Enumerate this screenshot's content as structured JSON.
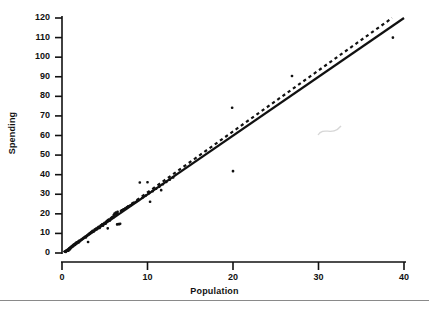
{
  "figure": {
    "background_color": "#ffffff",
    "ink_color": "#111111",
    "artifact_color": "#c8c8c8"
  },
  "chart_data": {
    "type": "scatter",
    "title": "",
    "subtitle": "",
    "xlabel": "Population",
    "ylabel": "Spending",
    "xlim": [
      0,
      40
    ],
    "ylim": [
      0,
      120
    ],
    "xticks": [
      0,
      10,
      20,
      30,
      40
    ],
    "yticks": [
      0,
      10,
      20,
      30,
      40,
      50,
      60,
      70,
      80,
      90,
      100,
      110,
      120
    ],
    "xtick_labels": [
      "0",
      "10",
      "20",
      "30",
      "40"
    ],
    "ytick_labels": [
      "0",
      "10",
      "20",
      "30",
      "40",
      "50",
      "60",
      "70",
      "80",
      "90",
      "100",
      "110",
      "120"
    ],
    "grid": false,
    "legend": null,
    "legend_position": "none",
    "marker": "filled-square-dot",
    "marker_size": 2.6,
    "points": [
      [
        0.45,
        0.6
      ],
      [
        0.55,
        1.0
      ],
      [
        0.6,
        1.3
      ],
      [
        0.7,
        1.5
      ],
      [
        0.75,
        1.2
      ],
      [
        0.8,
        2.0
      ],
      [
        0.85,
        1.8
      ],
      [
        0.9,
        2.4
      ],
      [
        0.95,
        2.0
      ],
      [
        1.0,
        2.6
      ],
      [
        1.05,
        3.0
      ],
      [
        1.1,
        2.8
      ],
      [
        1.15,
        3.4
      ],
      [
        1.2,
        3.2
      ],
      [
        1.25,
        3.8
      ],
      [
        1.3,
        3.5
      ],
      [
        1.35,
        4.2
      ],
      [
        1.4,
        4.0
      ],
      [
        1.45,
        4.4
      ],
      [
        1.5,
        4.1
      ],
      [
        1.55,
        4.8
      ],
      [
        1.6,
        4.5
      ],
      [
        1.65,
        5.2
      ],
      [
        1.7,
        4.9
      ],
      [
        1.75,
        5.5
      ],
      [
        1.8,
        5.1
      ],
      [
        1.9,
        5.8
      ],
      [
        1.95,
        5.4
      ],
      [
        2.0,
        6.2
      ],
      [
        2.1,
        6.0
      ],
      [
        2.2,
        6.6
      ],
      [
        2.3,
        6.9
      ],
      [
        2.4,
        7.2
      ],
      [
        2.5,
        7.6
      ],
      [
        2.6,
        7.9
      ],
      [
        2.7,
        8.3
      ],
      [
        2.8,
        8.0
      ],
      [
        2.9,
        8.8
      ],
      [
        3.0,
        9.2
      ],
      [
        3.05,
        5.6
      ],
      [
        3.1,
        9.5
      ],
      [
        3.2,
        9.9
      ],
      [
        3.3,
        10.2
      ],
      [
        3.4,
        10.6
      ],
      [
        3.5,
        10.9
      ],
      [
        3.6,
        11.3
      ],
      [
        3.7,
        11.0
      ],
      [
        3.8,
        11.8
      ],
      [
        3.9,
        12.1
      ],
      [
        4.0,
        12.5
      ],
      [
        4.1,
        12.2
      ],
      [
        4.2,
        13.0
      ],
      [
        4.3,
        13.4
      ],
      [
        4.4,
        12.8
      ],
      [
        4.5,
        13.9
      ],
      [
        4.6,
        14.2
      ],
      [
        4.7,
        14.6
      ],
      [
        4.8,
        14.0
      ],
      [
        4.9,
        15.1
      ],
      [
        5.0,
        15.4
      ],
      [
        5.1,
        15.0
      ],
      [
        5.2,
        16.0
      ],
      [
        5.3,
        16.4
      ],
      [
        5.35,
        12.6
      ],
      [
        5.4,
        16.8
      ],
      [
        5.5,
        17.1
      ],
      [
        5.6,
        16.6
      ],
      [
        5.7,
        17.6
      ],
      [
        5.8,
        18.0
      ],
      [
        5.9,
        18.4
      ],
      [
        6.0,
        18.1
      ],
      [
        6.05,
        19.4
      ],
      [
        6.1,
        19.0
      ],
      [
        6.15,
        20.2
      ],
      [
        6.2,
        19.7
      ],
      [
        6.3,
        20.6
      ],
      [
        6.4,
        20.0
      ],
      [
        6.45,
        14.6
      ],
      [
        6.5,
        21.0
      ],
      [
        6.6,
        14.8
      ],
      [
        6.7,
        14.7
      ],
      [
        6.8,
        14.9
      ],
      [
        6.9,
        21.4
      ],
      [
        7.0,
        21.8
      ],
      [
        7.2,
        22.3
      ],
      [
        7.4,
        22.8
      ],
      [
        7.6,
        23.4
      ],
      [
        7.8,
        23.9
      ],
      [
        8.0,
        24.4
      ],
      [
        8.2,
        25.0
      ],
      [
        8.4,
        25.5
      ],
      [
        8.6,
        26.0
      ],
      [
        8.8,
        26.6
      ],
      [
        9.0,
        27.1
      ],
      [
        9.1,
        36.0
      ],
      [
        9.4,
        28.2
      ],
      [
        9.8,
        29.4
      ],
      [
        10.0,
        36.1
      ],
      [
        10.2,
        30.6
      ],
      [
        10.3,
        26.2
      ],
      [
        10.6,
        31.6
      ],
      [
        11.0,
        32.8
      ],
      [
        11.4,
        33.9
      ],
      [
        11.6,
        32.1
      ],
      [
        11.8,
        35.1
      ],
      [
        12.2,
        36.3
      ],
      [
        12.6,
        37.4
      ],
      [
        13.0,
        38.6
      ],
      [
        19.9,
        74.2
      ],
      [
        20.0,
        41.8
      ],
      [
        26.9,
        90.4
      ],
      [
        38.7,
        110.0
      ]
    ],
    "fit_lines": [
      {
        "name": "solid-regression-line",
        "style": "solid",
        "color": "#111111",
        "width": 2.2,
        "x0": 0.2,
        "y0": 0.4,
        "x1": 40.0,
        "y1": 120.0
      },
      {
        "name": "dashed-regression-line",
        "style": "dashed",
        "color": "#111111",
        "width": 2.2,
        "dash": "3.2 3.2",
        "x0": 0.2,
        "y0": 0.4,
        "x1": 38.6,
        "y1": 120.0
      }
    ],
    "annotations": [
      {
        "name": "scan-artifact-squiggle",
        "kind": "noise",
        "x_px": 330,
        "y_px": 131
      }
    ]
  }
}
